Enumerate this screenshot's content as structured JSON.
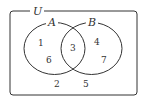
{
  "diagram": {
    "type": "venn",
    "universe": {
      "label": "U"
    },
    "sets": [
      {
        "label": "A"
      },
      {
        "label": "B"
      }
    ],
    "regions": {
      "A_only": [
        "1",
        "6"
      ],
      "A_and_B": [
        "3"
      ],
      "B_only": [
        "4",
        "7"
      ],
      "neither": [
        "2",
        "5"
      ]
    },
    "colors": {
      "stroke": "#333333",
      "background": "#ffffff"
    }
  }
}
